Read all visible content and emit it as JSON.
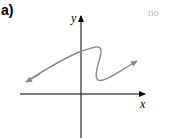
{
  "problem": {
    "label": "a)",
    "corner_text": "no"
  },
  "graph": {
    "x_axis_label": "x",
    "y_axis_label": "y",
    "axis_color": "#000000",
    "curve_color": "#8a8a8a",
    "curve_description": "S-shaped curve that fails the vertical line test; arrows at both ends"
  }
}
